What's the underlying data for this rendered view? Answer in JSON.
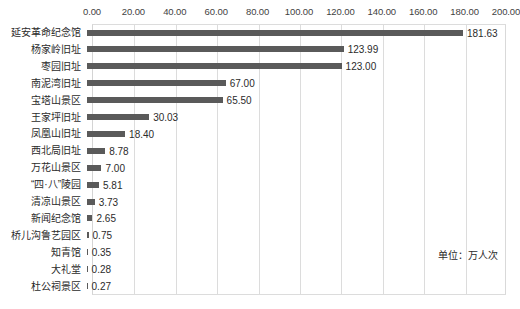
{
  "chart_data": {
    "type": "bar",
    "orientation": "horizontal",
    "title": "",
    "xlabel": "",
    "ylabel": "",
    "xlim": [
      0,
      200
    ],
    "grid": true,
    "legend": false,
    "annotation": "单位：万人次",
    "tick_labels": [
      "0.00",
      "20.00",
      "40.00",
      "60.00",
      "80.00",
      "100.00",
      "120.00",
      "140.00",
      "160.00",
      "180.00",
      "200.00"
    ],
    "tick_values": [
      0,
      20,
      40,
      60,
      80,
      100,
      120,
      140,
      160,
      180,
      200
    ],
    "categories": [
      "延安革命纪念馆",
      "杨家岭旧址",
      "枣园旧址",
      "南泥湾旧址",
      "宝塔山景区",
      "王家坪旧址",
      "凤凰山旧址",
      "西北局旧址",
      "万花山景区",
      "“四·八”陵园",
      "清凉山景区",
      "新闻纪念馆",
      "桥儿沟鲁艺园区",
      "知青馆",
      "大礼堂",
      "杜公祠景区"
    ],
    "values": [
      181.63,
      123.99,
      123.0,
      67.0,
      65.5,
      30.03,
      18.4,
      8.78,
      7.0,
      5.81,
      3.73,
      2.65,
      0.75,
      0.35,
      0.28,
      0.27
    ],
    "value_labels": [
      "181.63",
      "123.99",
      "123.00",
      "67.00",
      "65.50",
      "30.03",
      "18.40",
      "8.78",
      "7.00",
      "5.81",
      "3.73",
      "2.65",
      "0.75",
      "0.35",
      "0.28",
      "0.27"
    ],
    "colors": {
      "bar": "#5a5a5a",
      "gridline": "#dcdcdc",
      "text": "#2b2b2b",
      "background": "#ffffff"
    }
  }
}
